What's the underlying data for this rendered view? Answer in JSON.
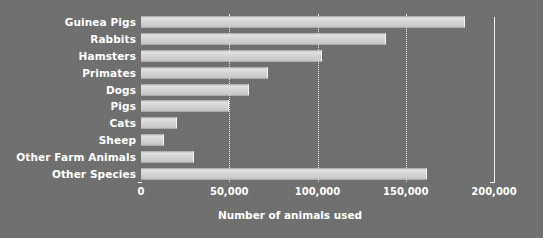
{
  "chart_data": {
    "type": "bar",
    "orientation": "horizontal",
    "title": "",
    "xlabel": "Number of animals used",
    "ylabel": "",
    "xlim": [
      0,
      200000
    ],
    "xticks": [
      0,
      50000,
      100000,
      150000,
      200000
    ],
    "xtick_labels": [
      "0",
      "50,000",
      "100,000",
      "150,000",
      "200,000"
    ],
    "gridlines": [
      50000,
      100000,
      150000
    ],
    "grid": true,
    "legend": null,
    "categories": [
      "Guinea Pigs",
      "Rabbits",
      "Hamsters",
      "Primates",
      "Dogs",
      "Pigs",
      "Cats",
      "Sheep",
      "Other Farm Animals",
      "Other Species"
    ],
    "values": [
      183500,
      138800,
      102500,
      72000,
      61200,
      49900,
      20400,
      13000,
      30000,
      162000
    ],
    "colors": {
      "background": "#6f6f6f",
      "bar": "#d5d5d5",
      "text": "#ffffff",
      "gridline": "#f2f2f2",
      "axis": "#f4f4f4"
    }
  }
}
